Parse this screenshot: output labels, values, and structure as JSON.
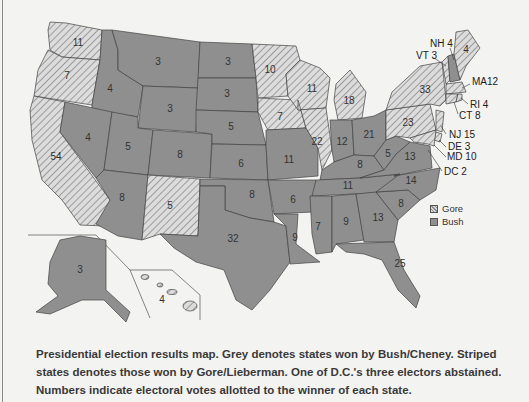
{
  "legend": {
    "items": [
      {
        "label": "Gore",
        "style": "striped"
      },
      {
        "label": "Bush",
        "style": "grey"
      }
    ]
  },
  "caption": {
    "line1": "Presidential election results map. Grey denotes states won by Bush/Cheney. Striped",
    "line2": "states denotes those won by Gore/Lieberman. One of D.C.'s three electors abstained.",
    "line3": "Numbers indicate electoral votes allotted to the winner of each state."
  },
  "colors": {
    "bush": "#8f8f8f",
    "gore_stripe_light": "#dcdcdc",
    "gore_stripe_dark": "#8a8a8a",
    "background": "#f3f3f1",
    "border": "#444444"
  },
  "states": {
    "WA": {
      "votes": "11",
      "winner": "Gore"
    },
    "OR": {
      "votes": "7",
      "winner": "Gore"
    },
    "CA": {
      "votes": "54",
      "winner": "Gore"
    },
    "ID": {
      "votes": "4",
      "winner": "Bush"
    },
    "NV": {
      "votes": "4",
      "winner": "Bush"
    },
    "MT": {
      "votes": "3",
      "winner": "Bush"
    },
    "WY": {
      "votes": "3",
      "winner": "Bush"
    },
    "UT": {
      "votes": "5",
      "winner": "Bush"
    },
    "AZ": {
      "votes": "8",
      "winner": "Bush"
    },
    "CO": {
      "votes": "8",
      "winner": "Bush"
    },
    "NM": {
      "votes": "5",
      "winner": "Gore"
    },
    "ND": {
      "votes": "3",
      "winner": "Bush"
    },
    "SD": {
      "votes": "3",
      "winner": "Bush"
    },
    "NE": {
      "votes": "5",
      "winner": "Bush"
    },
    "KS": {
      "votes": "6",
      "winner": "Bush"
    },
    "OK": {
      "votes": "8",
      "winner": "Bush"
    },
    "TX": {
      "votes": "32",
      "winner": "Bush"
    },
    "MN": {
      "votes": "10",
      "winner": "Gore"
    },
    "IA": {
      "votes": "7",
      "winner": "Gore"
    },
    "MO": {
      "votes": "11",
      "winner": "Bush"
    },
    "AR": {
      "votes": "6",
      "winner": "Bush"
    },
    "LA": {
      "votes": "9",
      "winner": "Bush"
    },
    "WI": {
      "votes": "11",
      "winner": "Gore"
    },
    "IL": {
      "votes": "22",
      "winner": "Gore"
    },
    "MI": {
      "votes": "18",
      "winner": "Gore"
    },
    "IN": {
      "votes": "12",
      "winner": "Bush"
    },
    "OH": {
      "votes": "21",
      "winner": "Bush"
    },
    "KY": {
      "votes": "8",
      "winner": "Bush"
    },
    "TN": {
      "votes": "11",
      "winner": "Bush"
    },
    "MS": {
      "votes": "7",
      "winner": "Bush"
    },
    "AL": {
      "votes": "9",
      "winner": "Bush"
    },
    "GA": {
      "votes": "13",
      "winner": "Bush"
    },
    "FL": {
      "votes": "25",
      "winner": "Bush"
    },
    "SC": {
      "votes": "8",
      "winner": "Bush"
    },
    "NC": {
      "votes": "14",
      "winner": "Bush"
    },
    "VA": {
      "votes": "13",
      "winner": "Bush"
    },
    "WV": {
      "votes": "5",
      "winner": "Bush"
    },
    "PA": {
      "votes": "23",
      "winner": "Gore"
    },
    "NY": {
      "votes": "33",
      "winner": "Gore"
    },
    "ME": {
      "votes": "4",
      "winner": "Gore"
    },
    "AK": {
      "votes": "3",
      "winner": "Bush"
    },
    "HI": {
      "votes": "4",
      "winner": "Gore"
    }
  },
  "callouts": {
    "NH": "NH 4",
    "VT": "VT 3",
    "MA": "MA12",
    "RI": "RI 4",
    "CT": "CT 8",
    "NJ": "NJ 15",
    "DE": "DE 3",
    "MD": "MD 10",
    "DC": "DC 2"
  }
}
